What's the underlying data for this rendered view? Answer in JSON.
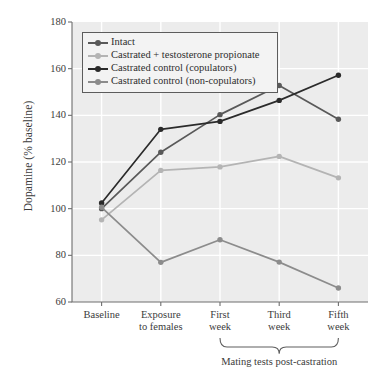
{
  "chart_data": {
    "type": "line",
    "title": "",
    "xlabel": "",
    "ylabel": "Dopamine (% baseline)",
    "categories": [
      "Baseline",
      "Exposure to females",
      "First week",
      "Third week",
      "Fifth week"
    ],
    "category_lines": [
      [
        "Baseline"
      ],
      [
        "Exposure",
        "to females"
      ],
      [
        "First",
        "week"
      ],
      [
        "Third",
        "week"
      ],
      [
        "Fifth",
        "week"
      ]
    ],
    "ylim": [
      60,
      180
    ],
    "yticks": [
      60,
      80,
      100,
      120,
      140,
      160,
      180
    ],
    "grid": true,
    "legend_position": "top-left",
    "annotation": {
      "text": "Mating tests post-castration",
      "spans_categories": [
        "First week",
        "Fifth week"
      ],
      "style": "curly-brace-below-axis"
    },
    "series": [
      {
        "name": "Intact",
        "color": "#595959",
        "values": [
          100.0,
          124.2,
          140.3,
          152.8,
          138.3
        ]
      },
      {
        "name": "Castrated + testosterone propionate",
        "color": "#b4b4b4",
        "values": [
          95.2,
          116.4,
          117.9,
          122.4,
          113.2
        ]
      },
      {
        "name": "Castrated control (copulators)",
        "color": "#2b2b2b",
        "values": [
          102.4,
          134.0,
          137.4,
          146.4,
          157.2
        ]
      },
      {
        "name": "Castrated control (non-copulators)",
        "color": "#8c8c8c",
        "values": [
          100.6,
          77.0,
          86.7,
          77.1,
          66.0
        ]
      }
    ]
  },
  "style": {
    "plot_background": "#ececec",
    "gridline_color": "#ffffff",
    "axis_color": "#6e6e6e",
    "text_color": "#3b3b3b",
    "legend_background": "#f3f3f3",
    "legend_border": "#5c5c5c"
  }
}
